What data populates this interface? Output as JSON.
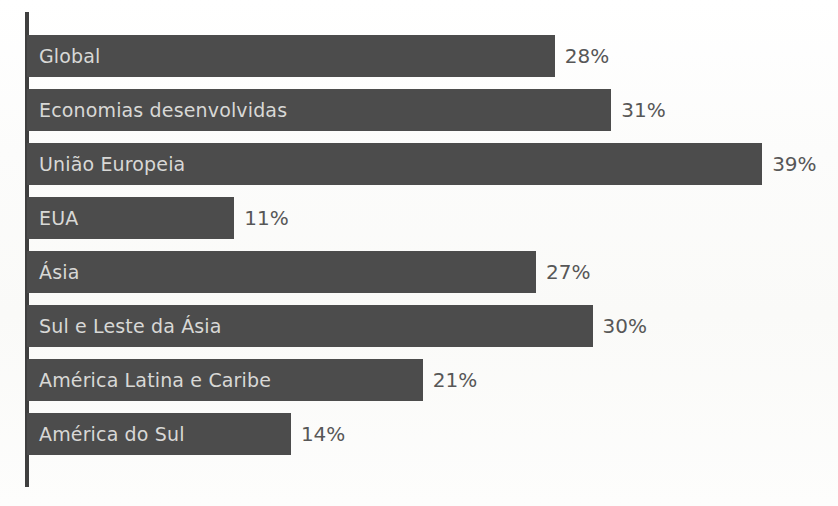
{
  "chart_data": {
    "type": "bar",
    "orientation": "horizontal",
    "title": "",
    "subtitle": "",
    "xlabel": "",
    "ylabel": "",
    "categories": [
      "Global",
      "Economias desenvolvidas",
      "União Europeia",
      "EUA",
      "Ásia",
      "Sul e Leste da Ásia",
      "América Latina e Caribe",
      "América do Sul"
    ],
    "values": [
      28,
      31,
      39,
      11,
      27,
      30,
      21,
      14
    ],
    "value_labels": [
      "28%",
      "31%",
      "39%",
      "11%",
      "27%",
      "30%",
      "21%",
      "14%"
    ],
    "unit": "%",
    "xlim": [
      0,
      43
    ],
    "grid": false,
    "legend": false,
    "legend_position": "none",
    "tick_labels_x": [],
    "tick_labels_y": [
      "Global",
      "Economias desenvolvidas",
      "União Europeia",
      "EUA",
      "Ásia",
      "Sul e Leste da Ásia",
      "América Latina e Caribe",
      "América do Sul"
    ],
    "annotations": [],
    "bar_color": "#4c4c4c",
    "category_label_color": "#d8d8d6",
    "value_label_color": "#575757",
    "axis_color": "#3f3f3f",
    "background_color": "#fdfdfc"
  },
  "bars": [
    {
      "category": "Global",
      "value": 28,
      "value_label": "28%"
    },
    {
      "category": "Economias desenvolvidas",
      "value": 31,
      "value_label": "31%"
    },
    {
      "category": "União Europeia",
      "value": 39,
      "value_label": "39%"
    },
    {
      "category": "EUA",
      "value": 11,
      "value_label": "11%"
    },
    {
      "category": "Ásia",
      "value": 27,
      "value_label": "27%"
    },
    {
      "category": "Sul e Leste da Ásia",
      "value": 30,
      "value_label": "30%"
    },
    {
      "category": "América Latina e Caribe",
      "value": 21,
      "value_label": "21%"
    },
    {
      "category": "América do Sul",
      "value": 14,
      "value_label": "14%"
    }
  ],
  "layout": {
    "bar_height": 42,
    "bar_gap": 12,
    "first_bar_top": 35,
    "axis_left": 25,
    "bars_left": 27,
    "px_per_unit": 18.85,
    "value_label_offset": 10
  }
}
